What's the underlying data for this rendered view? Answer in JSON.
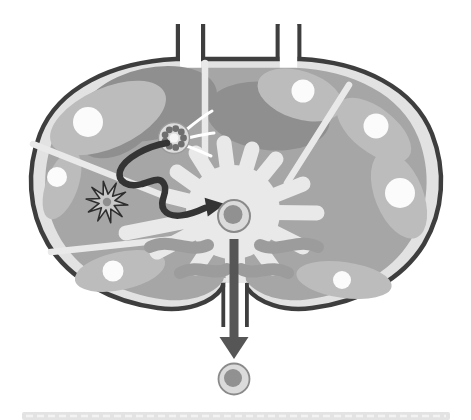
{
  "figure": {
    "kind": "biology-diagram",
    "icons": [
      "afferent-lymphatic-vessel-left",
      "afferent-lymphatic-vessel-right",
      "lymph-node-capsule",
      "subcapsular-sinus",
      "cortex-wedges",
      "lymphoid-follicles",
      "germinal-centers",
      "trabeculae",
      "medulla-splash",
      "medullary-cords",
      "high-endothelial-venule",
      "dendritic-cell",
      "migration-arrow",
      "central-lymphocyte",
      "efferent-lymphatic-vessel",
      "exit-arrow",
      "exported-lymphocyte",
      "caption-strip"
    ],
    "germinal_center_count": 7
  },
  "colors": {
    "background": "#ffffff",
    "capsule_outline": "#3e3e3e",
    "sinus": "#e2e2e2",
    "cortex": "#a6a6a6",
    "cortex_shadow": "#8f8f8f",
    "follicle": "#bcbcbc",
    "germinal_center": "#fbfbfb",
    "medulla": "#e9e9e9",
    "medullary_cord": "#9c9c9c",
    "trabecula": "#e9e9e9",
    "vessel_lumen": "#ffffff",
    "vessel_wall": "#3e3e3e",
    "hev_ring": "#dcdcdc",
    "hev_ring_stroke": "#9a9a9a",
    "hev_cell": "#6f6f6f",
    "hev_lumen": "#f5f5f5",
    "dendritic_fill": "#c9c9c9",
    "dendritic_outline": "#2e2e2e",
    "dendritic_nucleus": "#8e8e8e",
    "migration_arrow": "#343434",
    "exit_arrow": "#565656",
    "cell_body": "#dbdbdb",
    "cell_outline": "#8a8a8a",
    "cell_nucleus": "#919191",
    "caption_strip": "#e3e3e3",
    "caption_strip_dash": "#f3f3f3"
  }
}
